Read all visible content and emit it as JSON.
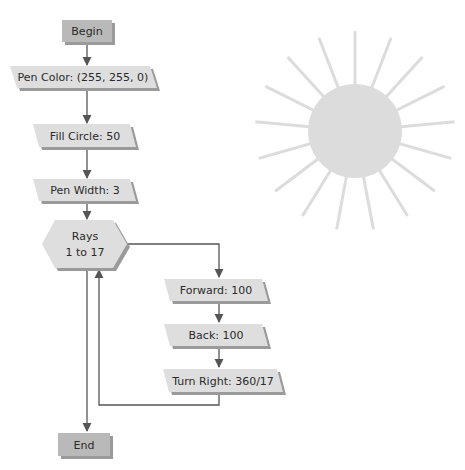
{
  "flowchart": {
    "begin": {
      "label": "Begin"
    },
    "steps": [
      {
        "label": "Pen Color: (255, 255, 0)"
      },
      {
        "label": "Fill Circle: 50"
      },
      {
        "label": "Pen Width: 3"
      }
    ],
    "loop": {
      "line1": "Rays",
      "line2": "1 to 17"
    },
    "loop_body": [
      {
        "label": "Forward: 100"
      },
      {
        "label": "Back: 100"
      },
      {
        "label": "Turn Right: 360/17"
      }
    ],
    "end": {
      "label": "End"
    }
  },
  "colors": {
    "terminal_fill": "#b9b9b9",
    "step_fill": "#dedede",
    "shadow": "#9a9a9a",
    "line": "#555555",
    "sun": "#dcdcdc"
  },
  "sun": {
    "rays": 17,
    "circle_radius": 47,
    "ray_length": 100
  }
}
